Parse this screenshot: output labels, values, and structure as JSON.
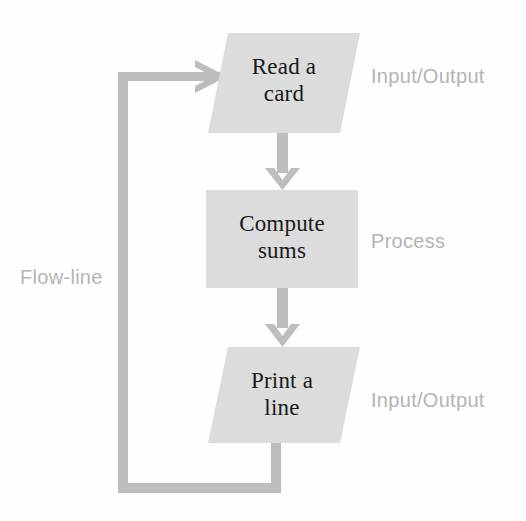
{
  "figure": {
    "background_color": "#fefefe"
  },
  "colors": {
    "shape_fill": "#dcdcdc",
    "shape_fill_alt": "#dddddd",
    "connector": "#b9b9b9",
    "connector_dark": "#b0b0b0",
    "node_text": "#1a1a1a",
    "annotation_text": "#b4b4b4"
  },
  "nodes": [
    {
      "id": "read-a-card",
      "shape": "parallelogram",
      "text": "Read a\ncard",
      "annotation": "Input/Output"
    },
    {
      "id": "compute-sums",
      "shape": "rectangle",
      "text": "Compute\nsums",
      "annotation": "Process"
    },
    {
      "id": "print-a-line",
      "shape": "parallelogram",
      "text": "Print a\nline",
      "annotation": "Input/Output"
    }
  ],
  "annotations": {
    "io_top": "Input/Output",
    "process": "Process",
    "io_bottom": "Input/Output",
    "flow_line": "Flow-line"
  },
  "connectors": [
    {
      "id": "read-to-compute",
      "from": "read-a-card",
      "to": "compute-sums",
      "direction": "down",
      "arrowhead": true
    },
    {
      "id": "compute-to-print",
      "from": "compute-sums",
      "to": "print-a-line",
      "direction": "down",
      "arrowhead": true
    },
    {
      "id": "print-to-read-loop",
      "from": "print-a-line",
      "to": "read-a-card",
      "direction": "loop-left",
      "arrowhead": true
    }
  ]
}
